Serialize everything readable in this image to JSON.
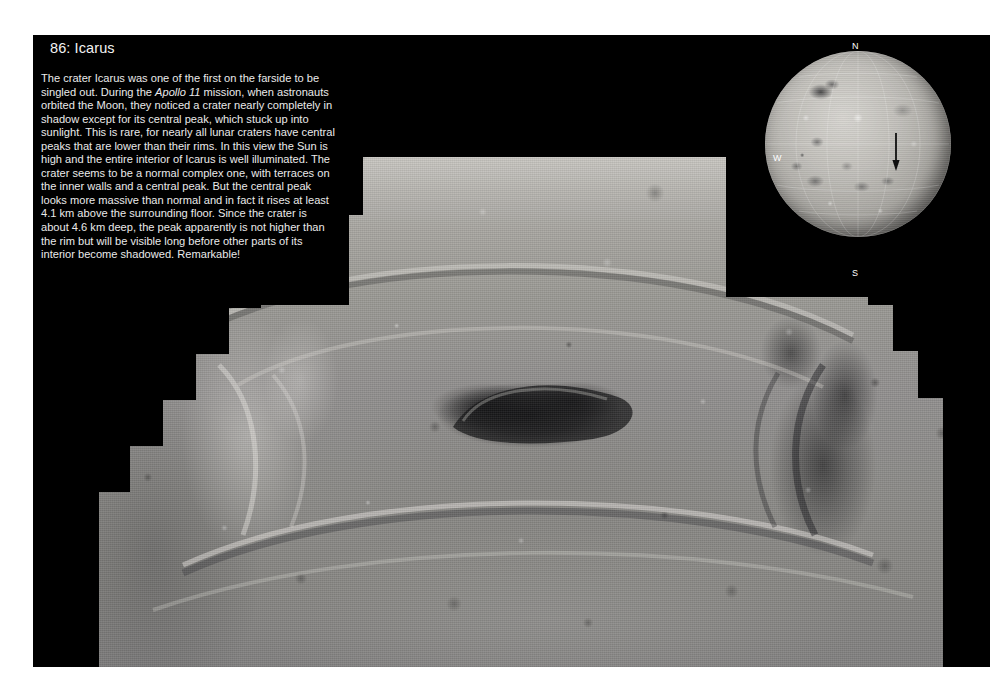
{
  "page": {
    "background_color": "#ffffff",
    "plate_color": "#000000"
  },
  "caption": {
    "title": "86: Icarus",
    "body_part1": "The crater Icarus was one of the first on the farside to be singled out. During the ",
    "body_italic": "Apollo 11",
    "body_part2": " mission, when astronauts orbited the Moon, they noticed a crater nearly completely in shadow except for its central peak, which stuck up into sunlight. This is rare, for nearly all lunar craters have central peaks that are lower than their rims. In this view the Sun is high and the entire interior of Icarus is well illuminated. The crater seems to be a normal complex one, with terraces on the inner walls and a central peak. But the central peak looks more massive than normal and in fact it rises at least 4.1 km above the surrounding floor. Since the crater is about 4.6 km deep, the peak apparently is not higher than the rim but will be visible long before other parts of its interior become shadowed. Remarkable!",
    "text_color": "#eaeaea"
  },
  "globe": {
    "label_north": "N",
    "label_south": "S",
    "label_west": "W",
    "label_east": "E",
    "marker": "down-arrow",
    "label_color": "#ffffff"
  },
  "main_image": {
    "subject": "oblique-view-lunar-crater-icarus",
    "mosaic_edge": "stair-step"
  }
}
